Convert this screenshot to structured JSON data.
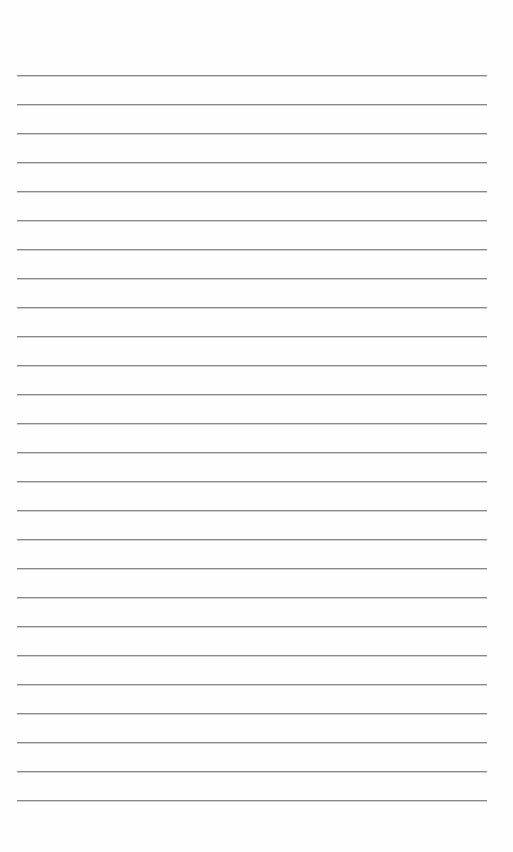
{
  "page": {
    "type": "lined-paper",
    "line_count": 26,
    "first_line_y": 75,
    "line_spacing": 29,
    "line_left": 17,
    "line_width": 470,
    "line_color": "#8a8a8a",
    "background_color": "#fefefe"
  }
}
